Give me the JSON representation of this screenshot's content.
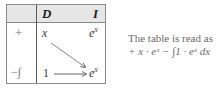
{
  "table": {
    "headers": {
      "sign": "",
      "d": "D",
      "i": "I"
    },
    "rows": [
      {
        "sign": "+",
        "d": "x",
        "i_base": "e",
        "i_exp": "x"
      },
      {
        "sign": "−∫",
        "d": "1",
        "i_base": "e",
        "i_exp": "x"
      }
    ],
    "arrows": [
      "diagonal x → e^x",
      "horizontal 1 → e^x"
    ]
  },
  "note": {
    "line1": "The table is read as",
    "line2": "+ x · eˣ − ∫1 · eˣ dx"
  },
  "colors": {
    "header_bg": "#e6e6e6",
    "border": "#8a8a8a",
    "text": "#3a3a3a"
  }
}
